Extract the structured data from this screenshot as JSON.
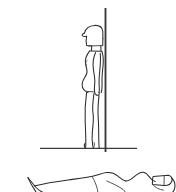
{
  "image": {
    "title": "Standing figure in profile beside vertical pole",
    "kind": "line-drawing",
    "width": 176,
    "height": 192,
    "background_color": "#ffffff",
    "ink_color": "#2b2b2b",
    "secondary_ink_color": "#4a4a4a",
    "technique": "contour line sketch, no shading, no color fill"
  },
  "scene": {
    "panel_top_label": "standing figure study",
    "panel_bottom_label": "reclining figure study (cropped)",
    "divider_note": "two separate sketches stacked vertically on blank page"
  },
  "standing_figure": {
    "label": "standing figure",
    "orientation": "side profile facing left",
    "head_label": "head with helmet or short cap",
    "face_label": "facial profile with nose and chin",
    "neck_label": "neck",
    "torso_label": "torso with rounded belly contour",
    "back_label": "back line",
    "arm_label": "near arm hanging straight down at side",
    "hand_label": "hand at hip level",
    "leg_front_label": "front leg",
    "leg_back_label": "back leg",
    "foot_label": "foot resting on ground line",
    "bounds": {
      "x": 78,
      "y": 25,
      "width": 34,
      "height": 124
    }
  },
  "pole": {
    "label": "vertical pole",
    "description": "thin straight vertical line passing behind the figure",
    "top_y": 8,
    "bottom_y": 152,
    "x": 105
  },
  "ground": {
    "label": "ground line",
    "description": "single horizontal baseline under the standing figure",
    "left_x": 40,
    "right_x": 137,
    "y": 148
  },
  "reclining_figure": {
    "label": "reclining figure",
    "orientation": "lying horizontally, head at right",
    "visibility": "cropped by bottom edge of image",
    "knee_label": "raised bent knee at left",
    "shin_label": "shin sloping down to left",
    "hip_label": "hip and thigh contour",
    "torso_label": "long torso contour",
    "chest_label": "chest rise",
    "shoulder_label": "shoulder bump",
    "head_label": "head with cap at right edge",
    "bounds": {
      "x": 26,
      "y": 168,
      "width": 150,
      "height": 24
    }
  }
}
